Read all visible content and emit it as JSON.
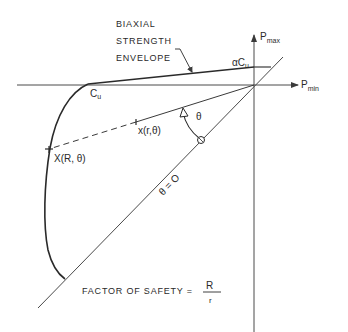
{
  "diagram": {
    "title_label": {
      "line1": "BIAXIAL",
      "line2": "STRENGTH",
      "line3": "ENVELOPE"
    },
    "axes": {
      "vertical": {
        "main": "P",
        "sub": "max"
      },
      "horizontal": {
        "main": "P",
        "sub": "min"
      }
    },
    "points": {
      "alpha_cu": {
        "prefix": "α",
        "main": "C",
        "sub": "u"
      },
      "cu": {
        "main": "C",
        "sub": "u"
      },
      "inner_point": "x(r,θ)",
      "outer_point": "X(R, θ)"
    },
    "angle_label": "θ",
    "zero_line_label": "θ = O",
    "formula": {
      "text": "FACTOR OF SAFETY =",
      "numerator": "R",
      "denominator": "r"
    },
    "colors": {
      "line": "#3a3a3a",
      "text": "#2a2a2a",
      "background": "#ffffff"
    }
  }
}
